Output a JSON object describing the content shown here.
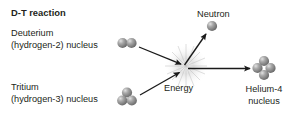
{
  "diagram": {
    "title": "D-T reaction",
    "labels": {
      "deuterium_line1": "Deuterium",
      "deuterium_line2": "(hydrogen-2) nucleus",
      "tritium_line1": "Tritium",
      "tritium_line2": "(hydrogen-3) nucleus",
      "neutron": "Neutron",
      "energy": "Energy",
      "helium_line1": "Helium-4",
      "helium_line2": "nucleus"
    },
    "colors": {
      "text": "#231f20",
      "sphere_base": "#8d8d8d",
      "sphere_highlight": "#d8d8d8",
      "sphere_shadow": "#5a5a5a",
      "arrow": "#1a1a1a",
      "background": "#ffffff",
      "burst": "#b5b5b5"
    },
    "particles": [
      {
        "name": "deuterium-nucleus",
        "count": 2,
        "cx": 127,
        "cy": 43
      },
      {
        "name": "tritium-nucleus",
        "count": 3,
        "cx": 127,
        "cy": 98
      },
      {
        "name": "neutron-particle",
        "count": 1,
        "cx": 212,
        "cy": 26
      },
      {
        "name": "helium-4-nucleus",
        "count": 4,
        "cx": 264,
        "cy": 68
      }
    ],
    "arrows": [
      {
        "name": "deuterium-to-energy",
        "x1": 139,
        "y1": 47,
        "x2": 183,
        "y2": 65
      },
      {
        "name": "tritium-to-energy",
        "x1": 140,
        "y1": 95,
        "x2": 181,
        "y2": 72
      },
      {
        "name": "energy-to-neutron",
        "x1": 184,
        "y1": 66,
        "x2": 207,
        "y2": 33
      },
      {
        "name": "energy-to-helium",
        "x1": 187,
        "y1": 69,
        "x2": 252,
        "y2": 69
      }
    ],
    "energy_center": {
      "cx": 186,
      "cy": 66
    }
  }
}
